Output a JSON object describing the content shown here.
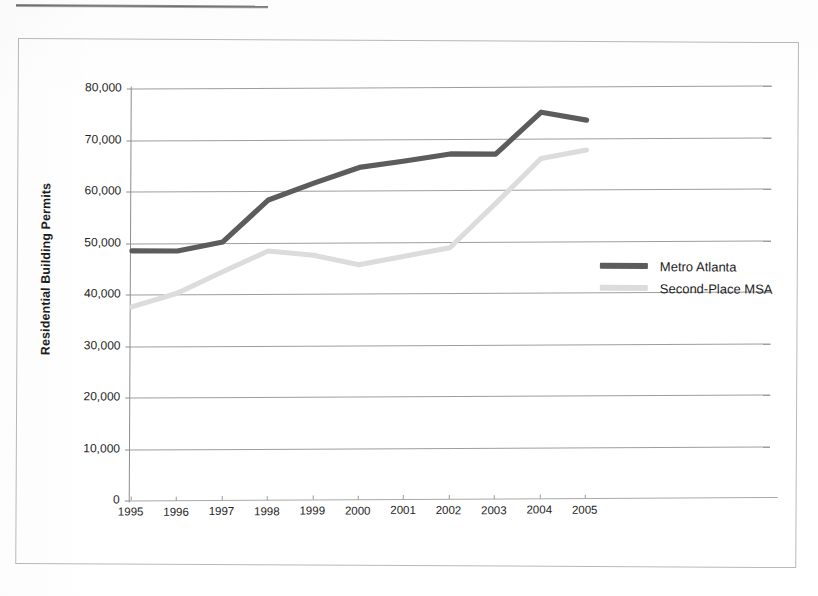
{
  "chart_data": {
    "type": "line",
    "title": "",
    "xlabel": "",
    "ylabel": "Residential Building Permits",
    "categories": [
      "1995",
      "1996",
      "1997",
      "1998",
      "1999",
      "2000",
      "2001",
      "2002",
      "2003",
      "2004",
      "2005"
    ],
    "x": [
      1995,
      1996,
      1997,
      1998,
      1999,
      2000,
      2001,
      2002,
      2003,
      2004,
      2005
    ],
    "ylim": [
      0,
      80000
    ],
    "ytick_labels": [
      "0",
      "10,000",
      "20,000",
      "30,000",
      "40,000",
      "50,000",
      "60,000",
      "70,000",
      "80,000"
    ],
    "ytick_values": [
      0,
      10000,
      20000,
      30000,
      40000,
      50000,
      60000,
      70000,
      80000
    ],
    "grid": "horizontal",
    "legend_position": "inside-right",
    "series": [
      {
        "name": "Metro Atlanta",
        "color": "#5c5c5c",
        "values": [
          48500,
          48500,
          50300,
          58500,
          61800,
          64900,
          66200,
          67600,
          67600,
          75800,
          74300
        ]
      },
      {
        "name": "Second-Place MSA",
        "color": "#dcdcdc",
        "values": [
          37600,
          40300,
          44500,
          48600,
          47800,
          46000,
          47700,
          49400,
          58000,
          66800,
          68500
        ]
      }
    ]
  },
  "axis": {
    "y_title": "Residential Building Permits"
  },
  "legend": {
    "entries": [
      {
        "label": "Metro Atlanta",
        "color": "#5c5c5c"
      },
      {
        "label": "Second-Place MSA",
        "color": "#dcdcdc"
      }
    ]
  }
}
